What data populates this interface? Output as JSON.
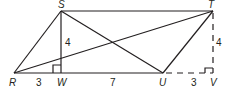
{
  "diagram": {
    "type": "parallelogram with diagonals and altitudes",
    "points": {
      "R": {
        "label": "R",
        "x": 14,
        "y": 73
      },
      "S": {
        "label": "S",
        "x": 61,
        "y": 11
      },
      "T": {
        "label": "T",
        "x": 213,
        "y": 11
      },
      "U": {
        "label": "U",
        "x": 163,
        "y": 73
      },
      "W": {
        "label": "W",
        "x": 61,
        "y": 73
      },
      "V": {
        "label": "V",
        "x": 213,
        "y": 73
      }
    },
    "segments": [
      {
        "from": "R",
        "to": "S",
        "style": "solid"
      },
      {
        "from": "S",
        "to": "T",
        "style": "solid"
      },
      {
        "from": "T",
        "to": "U",
        "style": "solid"
      },
      {
        "from": "R",
        "to": "U",
        "style": "solid"
      },
      {
        "from": "S",
        "to": "W",
        "style": "solid"
      },
      {
        "from": "R",
        "to": "T",
        "style": "solid"
      },
      {
        "from": "S",
        "to": "U",
        "style": "solid"
      },
      {
        "from": "U",
        "to": "V",
        "style": "dashed"
      },
      {
        "from": "T",
        "to": "V",
        "style": "dashed"
      }
    ],
    "right_angles": [
      "W",
      "V"
    ],
    "measures": {
      "SW": "4",
      "TV": "4",
      "RW": "3",
      "WU": "7",
      "UV": "3"
    },
    "line_color": "#231f20"
  }
}
